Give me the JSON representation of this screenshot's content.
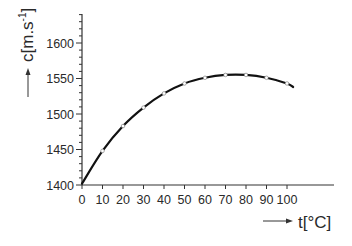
{
  "chart_data": {
    "type": "line",
    "title": "",
    "xlabel": "t[°C]",
    "ylabel": "c[m.s-1]",
    "ylabel_main": "c[m.s",
    "ylabel_sup": "-1",
    "ylabel_close": "]",
    "xlim": [
      0,
      125
    ],
    "ylim": [
      1400,
      1640
    ],
    "xticks": [
      0,
      10,
      20,
      30,
      40,
      50,
      60,
      70,
      80,
      90,
      100
    ],
    "xtick_labels": [
      "0",
      "10",
      "20",
      "30",
      "40",
      "50",
      "60",
      "70",
      "80",
      "90",
      "100"
    ],
    "yticks": [
      1400,
      1450,
      1500,
      1550,
      1600
    ],
    "ytick_labels": [
      "1400",
      "1450",
      "1500",
      "1550",
      "1600"
    ],
    "grid": false,
    "legend": null,
    "series": [
      {
        "name": "speed of sound in water",
        "x": [
          0,
          10,
          20,
          30,
          40,
          50,
          60,
          70,
          80,
          90,
          100
        ],
        "y": [
          1402,
          1448,
          1483,
          1509,
          1529,
          1543,
          1551,
          1555,
          1555,
          1551,
          1543
        ],
        "markers": "open-circle",
        "line_extends_to_x": 103,
        "line_end_y": 1538
      }
    ],
    "annotations": [
      "arrow beside y-axis label pointing up",
      "arrow beside x-axis label pointing right"
    ]
  },
  "colors": {
    "line": "#111111",
    "axis": "#333333",
    "marker_fill": "#ffffff",
    "text": "#2a2a2a"
  }
}
